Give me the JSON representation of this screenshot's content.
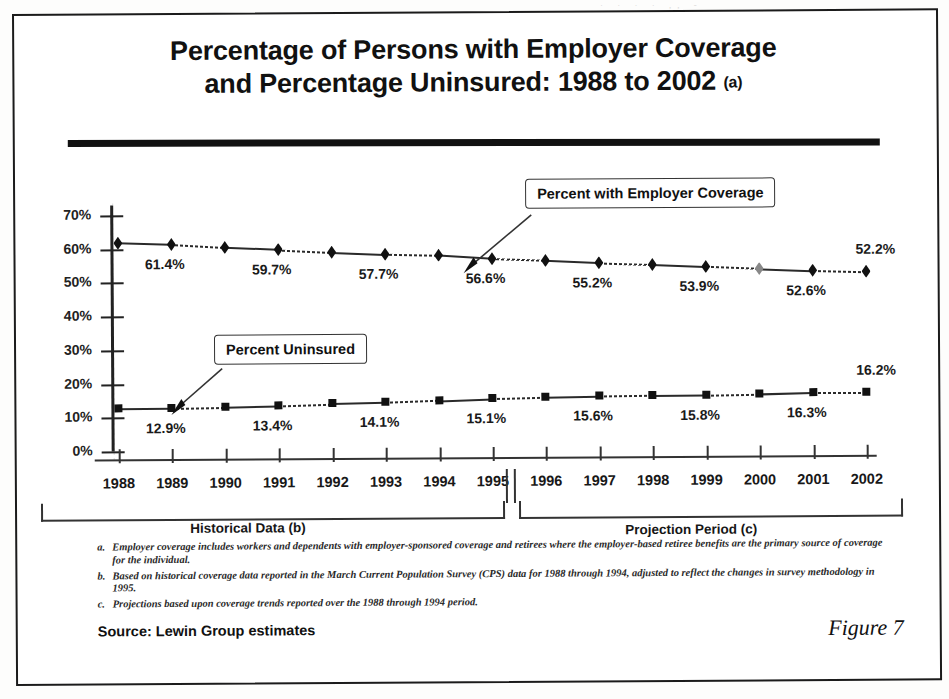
{
  "figure": {
    "label": "Figure 7",
    "source": "Source:  Lewin Group estimates",
    "bleed_artifact": "· ·  ·   ·  ,,  -"
  },
  "title": {
    "line1": "Percentage of Persons with Employer Coverage",
    "line2": "and Percentage Uninsured:  1988 to 2002",
    "superscript": "(a)"
  },
  "callouts": {
    "employer": "Percent with Employer Coverage",
    "uninsured": "Percent Uninsured"
  },
  "axis": {
    "y_ticks": [
      "70%",
      "60%",
      "50%",
      "40%",
      "30%",
      "20%",
      "10%",
      "0%"
    ],
    "historical_label": "Historical Data (b)",
    "projection_label": "Projection Period  (c)"
  },
  "footnotes": [
    {
      "mark": "a.",
      "text": "Employer coverage includes workers and dependents with employer-sponsored coverage and retirees where the employer-based retiree benefits are the primary source of coverage for the individual."
    },
    {
      "mark": "b.",
      "text": "Based on historical coverage data reported in the March Current Population Survey (CPS) data for 1988 through 1994, adjusted to reflect the changes in survey methodology in 1995."
    },
    {
      "mark": "c.",
      "text": "Projections based upon coverage trends reported over the 1988 through 1994 period."
    }
  ],
  "chart_data": {
    "type": "line",
    "title": "Percentage of Persons with Employer Coverage and Percentage Uninsured: 1988 to 2002 (a)",
    "xlabel": "",
    "ylabel": "",
    "ylim": [
      0,
      70
    ],
    "ytick_values": [
      0,
      10,
      20,
      30,
      40,
      50,
      60,
      70
    ],
    "grid": false,
    "legend_position": "callout-annotations",
    "categories": [
      "1988",
      "1989",
      "1990",
      "1991",
      "1992",
      "1993",
      "1994",
      "1995",
      "1996",
      "1997",
      "1998",
      "1999",
      "2000",
      "2001",
      "2002"
    ],
    "historical_years": [
      "1988",
      "1989",
      "1990",
      "1991",
      "1992",
      "1993",
      "1994",
      "1995"
    ],
    "projection_years": [
      "1996",
      "1997",
      "1998",
      "1999",
      "2000",
      "2001",
      "2002"
    ],
    "series": [
      {
        "name": "Percent with Employer Coverage",
        "marker": "diamond",
        "values": [
          61.9,
          61.4,
          60.4,
          59.7,
          58.8,
          58.1,
          57.7,
          56.6,
          56.0,
          55.2,
          54.6,
          53.9,
          53.2,
          52.6,
          52.2
        ],
        "labeled_points": [
          {
            "year": "1989",
            "label": "61.4%"
          },
          {
            "year": "1991",
            "label": "59.7%"
          },
          {
            "year": "1993",
            "label": "57.7%"
          },
          {
            "year": "1995",
            "label": "56.6%"
          },
          {
            "year": "1997",
            "label": "55.2%"
          },
          {
            "year": "1999",
            "label": "53.9%"
          },
          {
            "year": "2001",
            "label": "52.6%"
          },
          {
            "year": "2002",
            "label": "52.2%"
          }
        ]
      },
      {
        "name": "Percent Uninsured",
        "marker": "square",
        "values": [
          12.8,
          12.9,
          13.1,
          13.4,
          13.8,
          14.1,
          14.6,
          15.1,
          15.4,
          15.6,
          15.7,
          15.8,
          16.0,
          16.3,
          16.2
        ],
        "labeled_points": [
          {
            "year": "1989",
            "label": "12.9%"
          },
          {
            "year": "1991",
            "label": "13.4%"
          },
          {
            "year": "1993",
            "label": "14.1%"
          },
          {
            "year": "1995",
            "label": "15.1%"
          },
          {
            "year": "1997",
            "label": "15.6%"
          },
          {
            "year": "1999",
            "label": "15.8%"
          },
          {
            "year": "2001",
            "label": "16.3%"
          },
          {
            "year": "2002",
            "label": "16.2%"
          }
        ]
      }
    ]
  }
}
